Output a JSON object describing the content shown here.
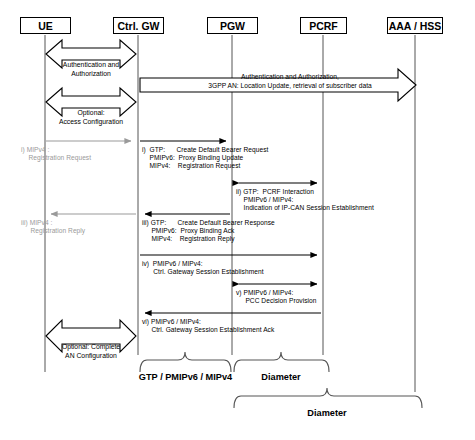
{
  "diagram": {
    "actors": [
      {
        "id": "ue",
        "label": "UE",
        "x": 45
      },
      {
        "id": "ctrl-gw",
        "label": "Ctrl. GW",
        "x": 138
      },
      {
        "id": "pgw",
        "label": "PGW",
        "x": 232
      },
      {
        "id": "pcrf",
        "label": "PCRF",
        "x": 323
      },
      {
        "id": "aaa-hss",
        "label": "AAA / HSS",
        "x": 415
      }
    ],
    "block_messages": [
      {
        "id": "auth-authorization",
        "lines": [
          "Authentication and",
          "Authorization"
        ],
        "from": "ue",
        "to": "ctrl-gw"
      },
      {
        "id": "optional-access-configuration",
        "lines": [
          "Optional:",
          "Access Configuration"
        ],
        "from": "ue",
        "to": "ctrl-gw"
      },
      {
        "id": "auth-authorization-core",
        "lines": [
          "Authentication and Authorization,",
          "3GPP AN: Location Update, retrieval of subscriber data"
        ],
        "from": "ctrl-gw",
        "to": "aaa-hss"
      },
      {
        "id": "optional-complete-an-configuration",
        "lines": [
          "Optional: Complete",
          "AN Configuration"
        ],
        "from": "ue",
        "to": "ctrl-gw"
      }
    ],
    "messages": [
      {
        "id": "msg-i-gray",
        "index": "i)",
        "lines": [
          "i) MIPv4 :",
          "    Registration Request"
        ],
        "style": "gray",
        "from": "ue",
        "to": "ctrl-gw",
        "direction": "right"
      },
      {
        "id": "msg-i",
        "index": "i)",
        "lines": [
          "i)  GTP:      Create Default Bearer Request",
          "    PMIPv6:  Proxy Binding Update",
          "    MIPv4:    Registration Request"
        ],
        "style": "black",
        "from": "ctrl-gw",
        "to": "pgw",
        "direction": "right"
      },
      {
        "id": "msg-ii",
        "index": "ii)",
        "lines": [
          "ii) GTP:  PCRF Interaction",
          "    PMIPv6 / MIPv4:",
          "    Indication of IP-CAN Session Establishment"
        ],
        "style": "black",
        "from": "pgw",
        "to": "pcrf",
        "direction": "both"
      },
      {
        "id": "msg-iii-gray",
        "index": "iii)",
        "lines": [
          "iii) MIPv4 :",
          "     Registration Reply"
        ],
        "style": "gray",
        "from": "ctrl-gw",
        "to": "ue",
        "direction": "left"
      },
      {
        "id": "msg-iii",
        "index": "iii)",
        "lines": [
          "iii) GTP:      Create Default Bearer Response",
          "     PMIPv6:  Proxy Binding Ack",
          "     MIPv4:    Registration Reply"
        ],
        "style": "black",
        "from": "pgw",
        "to": "ctrl-gw",
        "direction": "left"
      },
      {
        "id": "msg-iv",
        "index": "iv)",
        "lines": [
          "iv)  PMIPv6 / MIPv4:",
          "      Ctrl. Gateway Session Establishment"
        ],
        "style": "black",
        "from": "ctrl-gw",
        "to": "pcrf",
        "direction": "right"
      },
      {
        "id": "msg-v",
        "index": "v)",
        "lines": [
          "v) PMIPv6 / MIPv4:",
          "     PCC Decision Provision"
        ],
        "style": "black",
        "from": "pgw",
        "to": "pcrf",
        "direction": "both"
      },
      {
        "id": "msg-vi",
        "index": "vi)",
        "lines": [
          "vi) PMIPv6 / MIPv4:",
          "     Ctrl. Gateway Session Establishment Ack"
        ],
        "style": "black",
        "from": "pcrf",
        "to": "ctrl-gw",
        "direction": "left"
      }
    ],
    "braces": [
      {
        "id": "brace-gtp-pmipv6-mipv4",
        "label": "GTP / PMIPv6 / MIPv4",
        "from_x": 140,
        "to_x": 231,
        "y": 358
      },
      {
        "id": "brace-diameter-pgw-pcrf",
        "label": "Diameter",
        "from_x": 233,
        "to_x": 330,
        "y": 358
      },
      {
        "id": "brace-diameter-pgw-aaa",
        "label": "Diameter",
        "from_x": 233,
        "to_x": 423,
        "y": 394
      }
    ]
  },
  "text": {
    "auth_line1": "Authentication and",
    "auth_line2": "Authorization",
    "opt_access_line1": "Optional:",
    "opt_access_line2": "Access Configuration",
    "core_auth_line1": "Authentication and Authorization,",
    "core_auth_line2": "3GPP AN: Location Update, retrieval of subscriber data",
    "opt_complete_line1": "Optional: Complete",
    "opt_complete_line2": "AN Configuration",
    "msg_i_gray": "i) MIPv4 :\n    Registration Reply",
    "brace1": "GTP / PMIPv6 / MIPv4",
    "brace2": "Diameter",
    "brace3": "Diameter"
  }
}
